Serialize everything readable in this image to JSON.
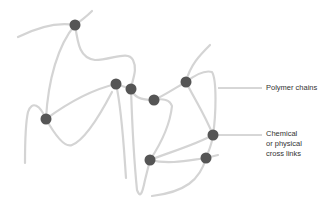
{
  "diagram": {
    "type": "polymer-network-schematic",
    "colors": {
      "chain": "#d4d4d4",
      "node": "#555555",
      "leader": "#9a9a9a",
      "text": "#333333",
      "background": "#ffffff"
    },
    "labels": {
      "polymer_chains": "Polymer chains",
      "cross_links": [
        "Chemical",
        "or physical",
        "cross links"
      ]
    },
    "nodes": [
      {
        "id": "n1",
        "x": 75,
        "y": 25
      },
      {
        "id": "n2",
        "x": 46,
        "y": 119
      },
      {
        "id": "n3",
        "x": 116,
        "y": 84
      },
      {
        "id": "n4",
        "x": 131,
        "y": 89
      },
      {
        "id": "n5",
        "x": 154,
        "y": 100
      },
      {
        "id": "n6",
        "x": 186,
        "y": 82
      },
      {
        "id": "n7",
        "x": 213,
        "y": 135
      },
      {
        "id": "n8",
        "x": 150,
        "y": 160
      },
      {
        "id": "n9",
        "x": 206,
        "y": 158
      }
    ],
    "node_radius": 5.5
  }
}
